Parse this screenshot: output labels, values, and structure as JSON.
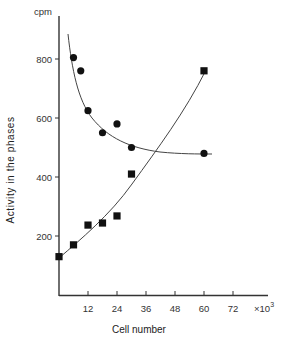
{
  "chart_data": {
    "type": "scatter",
    "title": "",
    "xlabel": "Cell number",
    "ylabel": "Activity in the phases",
    "y_unit_label": "cpm",
    "x_multiplier_label": "×10",
    "x_multiplier_exponent": "3",
    "xlim": [
      0,
      78
    ],
    "ylim": [
      0,
      900
    ],
    "x_ticks": [
      12,
      24,
      36,
      48,
      60,
      72
    ],
    "x_tick_labels": [
      "12",
      "24",
      "36",
      "48",
      "60",
      "72"
    ],
    "y_ticks": [
      200,
      400,
      600,
      800
    ],
    "y_tick_labels": [
      "200",
      "400",
      "600",
      "800"
    ],
    "grid": false,
    "legend": null,
    "series": [
      {
        "name": "circles",
        "marker": "circle",
        "color": "#111111",
        "points": [
          {
            "x": 6,
            "y": 805
          },
          {
            "x": 9,
            "y": 760
          },
          {
            "x": 12,
            "y": 625
          },
          {
            "x": 18,
            "y": 550
          },
          {
            "x": 24,
            "y": 580
          },
          {
            "x": 30,
            "y": 500
          },
          {
            "x": 60,
            "y": 480
          }
        ],
        "fit_curve": "decreasing exponential, from about (3, 880) flattening to about (63, 478)"
      },
      {
        "name": "squares",
        "marker": "square",
        "color": "#111111",
        "points": [
          {
            "x": 0,
            "y": 130
          },
          {
            "x": 6,
            "y": 170
          },
          {
            "x": 12,
            "y": 237
          },
          {
            "x": 18,
            "y": 244
          },
          {
            "x": 24,
            "y": 268
          },
          {
            "x": 30,
            "y": 410
          },
          {
            "x": 60,
            "y": 760
          }
        ],
        "fit_curve": "increasing concave-up curve from (0, 130) to (60, 760)"
      }
    ],
    "annotations": [
      {
        "text": "curves intersect",
        "x": 40,
        "y": 485
      }
    ]
  }
}
